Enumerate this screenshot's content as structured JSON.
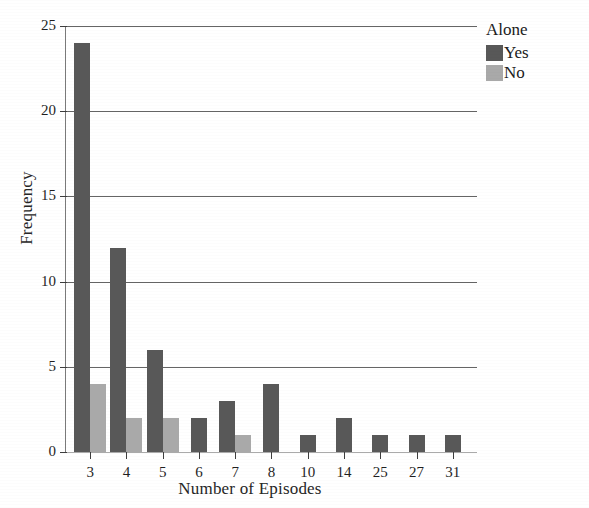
{
  "chart_data": {
    "type": "bar",
    "title": "",
    "xlabel": "Number of Episodes",
    "ylabel": "Frequency",
    "categories": [
      "3",
      "4",
      "5",
      "6",
      "7",
      "8",
      "10",
      "14",
      "25",
      "27",
      "31"
    ],
    "series": [
      {
        "name": "Yes",
        "color": "#585858",
        "values": [
          24,
          12,
          6,
          2,
          3,
          4,
          1,
          2,
          1,
          1,
          1
        ]
      },
      {
        "name": "No",
        "color": "#a9a9a9",
        "values": [
          4,
          2,
          2,
          0,
          1,
          0,
          0,
          0,
          0,
          0,
          0
        ]
      }
    ],
    "ylim": [
      0,
      25
    ],
    "yticks": [
      "0",
      "5",
      "10",
      "15",
      "20",
      "25"
    ],
    "ytick_values": [
      0,
      5,
      10,
      15,
      20,
      25
    ],
    "grid": true,
    "grid_axis": "y",
    "legend": {
      "title": "Alone",
      "position": "right-top",
      "entries": [
        {
          "label": "Yes",
          "color": "#585858"
        },
        {
          "label": "No",
          "color": "#a9a9a9"
        }
      ]
    }
  }
}
